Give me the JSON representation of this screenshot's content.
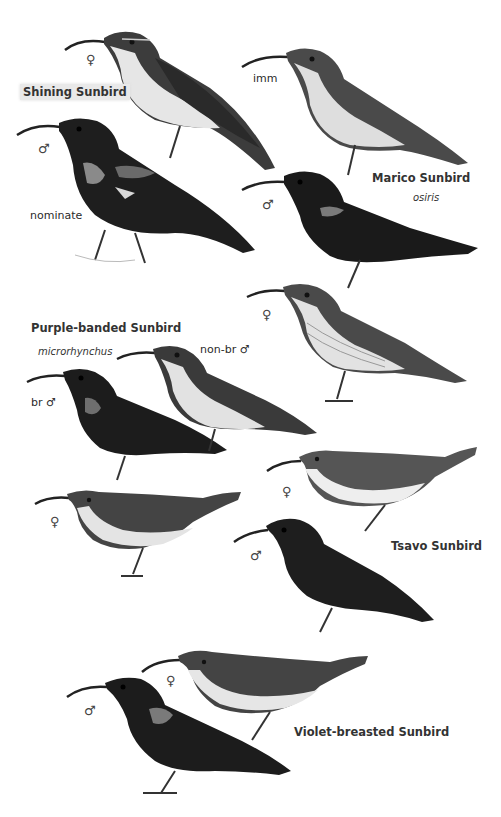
{
  "plate": {
    "background": "#ffffff",
    "species": [
      {
        "name": "Shining Sunbird",
        "subspecies": "nominate",
        "figures": [
          {
            "label": "♀",
            "desc": "female"
          },
          {
            "label": "♂",
            "desc": "male"
          }
        ]
      },
      {
        "name": "Marico Sunbird",
        "subspecies": "osiris",
        "figures": [
          {
            "label": "imm",
            "desc": "immature"
          },
          {
            "label": "♂",
            "desc": "male"
          },
          {
            "label": "♀",
            "desc": "female"
          }
        ]
      },
      {
        "name": "Purple-banded Sunbird",
        "subspecies": "microrhynchus",
        "figures": [
          {
            "label": "br ♂",
            "desc": "breeding male"
          },
          {
            "label": "non-br ♂",
            "desc": "non-breeding male"
          },
          {
            "label": "♀",
            "desc": "female"
          }
        ]
      },
      {
        "name": "Tsavo Sunbird",
        "figures": [
          {
            "label": "♀",
            "desc": "female"
          },
          {
            "label": "♂",
            "desc": "male"
          }
        ]
      },
      {
        "name": "Violet-breasted Sunbird",
        "figures": [
          {
            "label": "♀",
            "desc": "female"
          },
          {
            "label": "♂",
            "desc": "male"
          }
        ]
      }
    ],
    "colors": {
      "dark_bird": "#1c1c1c",
      "mid_bird": "#4a4a4a",
      "pale_underparts": "#e4e4e4",
      "label_highlight": "#e9e9e9"
    }
  }
}
